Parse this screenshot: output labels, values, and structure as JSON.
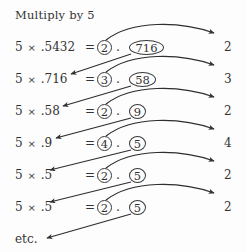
{
  "title": "Multiply by 5",
  "footer_label": "etc.",
  "colors": {
    "ink": "#333333",
    "stroke": "#3a3a3a",
    "background": "#fdfdfd"
  },
  "symbols": {
    "multiplication_sign": "×",
    "equals_sign": "=",
    "decimal_point": "."
  },
  "rows": [
    {
      "multiplier": "5",
      "operand": ".5432",
      "equals": "=",
      "circled_units": "2",
      "decimal": ".",
      "circled_fraction": "716",
      "result_digit": "2",
      "top": 40,
      "units_left": 97,
      "dot_left": 116,
      "frac_left": 129,
      "frac_width": 35,
      "rhs_left": 224
    },
    {
      "multiplier": "5",
      "operand": ".716",
      "equals": "=",
      "circled_units": "3",
      "decimal": ".",
      "circled_fraction": "58",
      "result_digit": "3",
      "top": 72,
      "units_left": 97,
      "dot_left": 116,
      "frac_left": 129,
      "frac_width": 27,
      "rhs_left": 224
    },
    {
      "multiplier": "5",
      "operand": ".58",
      "equals": "=",
      "circled_units": "2",
      "decimal": ".",
      "circled_fraction": "9",
      "result_digit": "2",
      "top": 104,
      "units_left": 97,
      "dot_left": 116,
      "frac_left": 129,
      "frac_width": 17,
      "rhs_left": 224
    },
    {
      "multiplier": "5",
      "operand": ".9",
      "equals": "=",
      "circled_units": "4",
      "decimal": ".",
      "circled_fraction": "5",
      "result_digit": "4",
      "top": 136,
      "units_left": 97,
      "dot_left": 116,
      "frac_left": 129,
      "frac_width": 17,
      "rhs_left": 224
    },
    {
      "multiplier": "5",
      "operand": ".5",
      "equals": "=",
      "circled_units": "2",
      "decimal": ".",
      "circled_fraction": "5",
      "result_digit": "2",
      "top": 168,
      "units_left": 97,
      "dot_left": 116,
      "frac_left": 129,
      "frac_width": 17,
      "rhs_left": 224
    },
    {
      "multiplier": "5",
      "operand": ".5",
      "equals": "=",
      "circled_units": "2",
      "decimal": ".",
      "circled_fraction": "5",
      "result_digit": "2",
      "top": 200,
      "units_left": 97,
      "dot_left": 116,
      "frac_left": 129,
      "frac_width": 17,
      "rhs_left": 224
    }
  ],
  "footer_top": 232,
  "eq_left": 85,
  "annotations": {
    "carry_arcs_label": "units-digit-to-result-arc",
    "carry_down_label": "fraction-to-next-operand-arrow"
  }
}
